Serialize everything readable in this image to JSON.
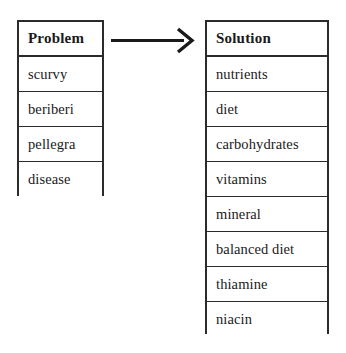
{
  "diagram": {
    "type": "two-column-mapping",
    "background_color": "#ffffff",
    "line_color": "#2b2b2b",
    "text_color": "#1a1a1a"
  },
  "problem_table": {
    "header": "Problem",
    "items": [
      "scurvy",
      "beriberi",
      "pellegra",
      "disease"
    ]
  },
  "arrow": {
    "name": "maps-to-arrow",
    "direction": "left-to-right",
    "style": "open-chevron-head",
    "label": ""
  },
  "solution_table": {
    "header": "Solution",
    "items": [
      "nutrients",
      "diet",
      "carbohydrates",
      "vitamins",
      "mineral",
      "balanced diet",
      "thiamine",
      "niacin"
    ]
  }
}
